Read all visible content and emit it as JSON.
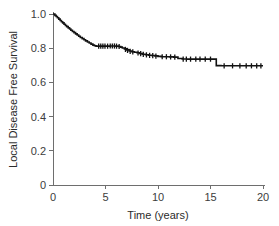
{
  "figure": {
    "background_color": "#ffffff",
    "curve_color": "#121212",
    "axis_color": "#6e6e6e",
    "text_color": "#2b2b2b"
  },
  "chart_data": {
    "type": "line",
    "plot_kind": "kaplan-meier-survival",
    "title": "",
    "subtitle": "",
    "xlabel": "Time (years)",
    "ylabel": "Local Disease Free Survival",
    "xlim": [
      0,
      20
    ],
    "ylim": [
      0,
      1.0
    ],
    "xticks": [
      0,
      5,
      10,
      15,
      20
    ],
    "xticklabels": [
      "0",
      "5",
      "10",
      "15",
      "20"
    ],
    "yticks": [
      0,
      0.2,
      0.4,
      0.6,
      0.8,
      1.0
    ],
    "yticklabels": [
      "0",
      "0.2",
      "0.4",
      "0.6",
      "0.8",
      "1.0"
    ],
    "grid": false,
    "legend": null,
    "legend_position": "none",
    "annotations": [],
    "series": [
      {
        "name": "Local Disease Free Survival",
        "color": "#121212",
        "step_type": "post",
        "start_value": 1.0,
        "end_value": 0.697,
        "x": [
          0.0,
          0.18,
          0.3,
          0.42,
          0.55,
          0.68,
          0.8,
          0.92,
          1.05,
          1.18,
          1.3,
          1.45,
          1.58,
          1.7,
          1.85,
          2.0,
          2.15,
          2.3,
          2.45,
          2.6,
          2.78,
          2.95,
          3.1,
          3.28,
          3.45,
          3.62,
          3.8,
          3.95,
          4.1,
          4.3,
          4.55,
          4.8,
          5.1,
          5.4,
          5.7,
          6.0,
          6.25,
          6.45,
          6.6,
          6.8,
          7.0,
          7.25,
          7.5,
          7.75,
          8.0,
          8.25,
          8.5,
          8.8,
          9.1,
          9.4,
          9.7,
          10.0,
          10.3,
          10.7,
          11.1,
          11.5,
          11.9,
          12.3,
          12.8,
          13.3,
          13.8,
          14.3,
          14.8,
          15.3,
          15.55,
          16.0,
          16.6,
          17.2,
          17.9,
          18.5,
          19.1,
          19.6,
          20.0
        ],
        "y": [
          1.0,
          0.992,
          0.985,
          0.978,
          0.97,
          0.962,
          0.955,
          0.948,
          0.94,
          0.933,
          0.926,
          0.919,
          0.912,
          0.905,
          0.898,
          0.891,
          0.884,
          0.877,
          0.87,
          0.863,
          0.856,
          0.849,
          0.843,
          0.836,
          0.83,
          0.824,
          0.818,
          0.814,
          0.812,
          0.812,
          0.812,
          0.812,
          0.812,
          0.813,
          0.813,
          0.812,
          0.81,
          0.806,
          0.801,
          0.796,
          0.79,
          0.784,
          0.779,
          0.776,
          0.773,
          0.769,
          0.765,
          0.762,
          0.759,
          0.757,
          0.755,
          0.752,
          0.75,
          0.75,
          0.749,
          0.748,
          0.74,
          0.737,
          0.736,
          0.736,
          0.736,
          0.736,
          0.736,
          0.736,
          0.698,
          0.697,
          0.697,
          0.697,
          0.697,
          0.697,
          0.697,
          0.697,
          0.697
        ],
        "censored_points": [
          {
            "x": 4.35,
            "y": 0.812
          },
          {
            "x": 4.55,
            "y": 0.812
          },
          {
            "x": 4.75,
            "y": 0.812
          },
          {
            "x": 4.95,
            "y": 0.812
          },
          {
            "x": 5.2,
            "y": 0.812
          },
          {
            "x": 5.45,
            "y": 0.813
          },
          {
            "x": 5.65,
            "y": 0.813
          },
          {
            "x": 5.85,
            "y": 0.813
          },
          {
            "x": 6.05,
            "y": 0.812
          },
          {
            "x": 6.3,
            "y": 0.81
          },
          {
            "x": 6.9,
            "y": 0.793
          },
          {
            "x": 7.1,
            "y": 0.787
          },
          {
            "x": 7.35,
            "y": 0.781
          },
          {
            "x": 7.6,
            "y": 0.778
          },
          {
            "x": 8.1,
            "y": 0.772
          },
          {
            "x": 8.35,
            "y": 0.768
          },
          {
            "x": 8.6,
            "y": 0.764
          },
          {
            "x": 8.9,
            "y": 0.761
          },
          {
            "x": 9.2,
            "y": 0.758
          },
          {
            "x": 9.5,
            "y": 0.756
          },
          {
            "x": 9.8,
            "y": 0.754
          },
          {
            "x": 10.4,
            "y": 0.75
          },
          {
            "x": 10.8,
            "y": 0.75
          },
          {
            "x": 11.2,
            "y": 0.749
          },
          {
            "x": 11.6,
            "y": 0.748
          },
          {
            "x": 12.4,
            "y": 0.736
          },
          {
            "x": 12.7,
            "y": 0.736
          },
          {
            "x": 13.1,
            "y": 0.736
          },
          {
            "x": 13.6,
            "y": 0.736
          },
          {
            "x": 14.0,
            "y": 0.736
          },
          {
            "x": 14.5,
            "y": 0.736
          },
          {
            "x": 15.0,
            "y": 0.736
          },
          {
            "x": 16.3,
            "y": 0.697
          },
          {
            "x": 17.1,
            "y": 0.697
          },
          {
            "x": 17.8,
            "y": 0.697
          },
          {
            "x": 18.4,
            "y": 0.697
          },
          {
            "x": 18.9,
            "y": 0.697
          },
          {
            "x": 19.4,
            "y": 0.697
          },
          {
            "x": 19.8,
            "y": 0.697
          }
        ]
      }
    ]
  }
}
